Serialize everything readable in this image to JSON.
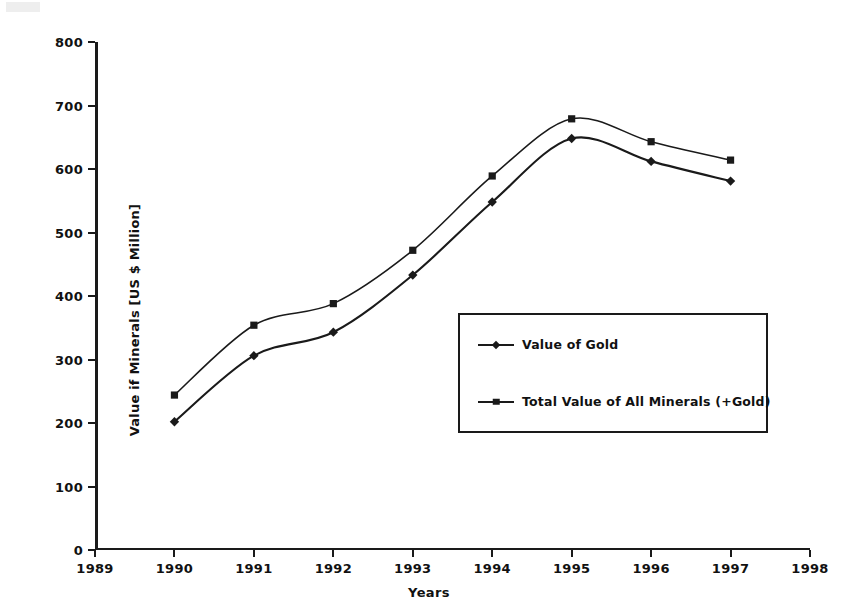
{
  "chart_data": {
    "type": "line",
    "title": "",
    "xlabel": "Years",
    "ylabel": "Value if Minerals [US $ Million]",
    "x": [
      1990,
      1991,
      1992,
      1993,
      1994,
      1995,
      1996,
      1997
    ],
    "xlim": [
      1989,
      1998
    ],
    "ylim": [
      0,
      800
    ],
    "xticks": [
      "1989",
      "1990",
      "1991",
      "1992",
      "1993",
      "1994",
      "1995",
      "1996",
      "1997",
      "1998"
    ],
    "yticks": [
      "0",
      "100",
      "200",
      "300",
      "400",
      "500",
      "600",
      "700",
      "800"
    ],
    "grid": false,
    "legend_position": "center-right",
    "series": [
      {
        "name": "Value of Gold",
        "marker": "diamond",
        "values": [
          202,
          306,
          343,
          433,
          548,
          648,
          612,
          581
        ]
      },
      {
        "name": "Total Value of All Minerals (+Gold)",
        "marker": "square",
        "values": [
          244,
          354,
          388,
          472,
          589,
          679,
          643,
          614
        ]
      }
    ]
  },
  "legend": {
    "items": [
      {
        "label": "Value of Gold",
        "marker": "diamond"
      },
      {
        "label": "Total Value of All Minerals (+Gold)",
        "marker": "square"
      }
    ]
  },
  "colors": {
    "ink": "#1a1a1a",
    "background": "#ffffff"
  }
}
